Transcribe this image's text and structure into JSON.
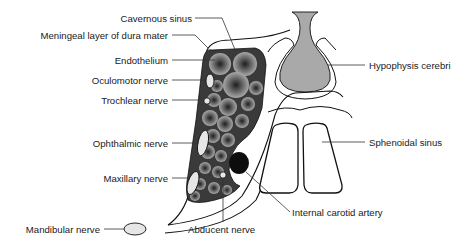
{
  "diagram": {
    "colors": {
      "background": "#ffffff",
      "outline": "#111111",
      "sinus_fill": "#3a3a3a",
      "cell_light": "#9a9a9a",
      "cell_dark": "#2a2a2a",
      "hypophysis_fill": "#a9a9a9",
      "nerve_fill": "#e6e6e6",
      "artery_fill": "#0d0d0d",
      "leader_line": "#333333"
    },
    "labels": {
      "cavernous_sinus": "Cavernous sinus",
      "meningeal_layer": "Meningeal layer of dura mater",
      "endothelium": "Endothelium",
      "oculomotor_nerve": "Oculomotor nerve",
      "trochlear_nerve": "Trochlear nerve",
      "ophthalmic_nerve": "Ophthalmic nerve",
      "maxillary_nerve": "Maxillary nerve",
      "mandibular_nerve": "Mandibular nerve",
      "abducent_nerve": "Abducent nerve",
      "internal_carotid_artery": "Internal carotid artery",
      "hypophysis_cerebri": "Hypophysis cerebri",
      "sphenoidal_sinus": "Sphenoidal sinus"
    }
  }
}
